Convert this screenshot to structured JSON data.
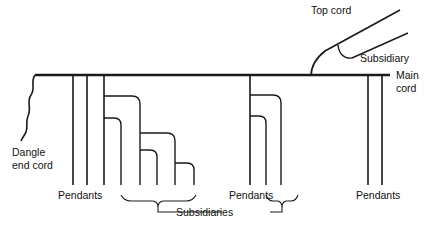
{
  "diagram": {
    "labels": {
      "dangle_end_cord_line1": "Dangle",
      "dangle_end_cord_line2": "end cord",
      "pendants_left": "Pendants",
      "pendants_middle": "Pendants",
      "pendants_right": "Pendants",
      "subsidiaries": "Subsidiaries",
      "subsidiary": "Subsidiary",
      "top_cord": "Top cord",
      "main_cord_line1": "Main",
      "main_cord_line2": "cord"
    },
    "colors": {
      "stroke": "#1a1a1a",
      "background": "#ffffff",
      "text": "#111111"
    },
    "structure": {
      "main_cord": {
        "x1": 35,
        "x2": 390,
        "y": 75
      },
      "dangle_end_cord": {
        "from_x": 35,
        "from_y": 75,
        "to_x": 22,
        "to_y": 140
      },
      "left_pendants_x": [
        73,
        87
      ],
      "middle_left_group_x": [
        104,
        121,
        140,
        157,
        175
      ],
      "middle_right_group_x": [
        250,
        266,
        281
      ],
      "right_pendants_x": [
        368,
        382
      ],
      "top_cord": {
        "base_x": 312,
        "base_y": 75,
        "tip_x": 400,
        "tip_y": 10
      },
      "subsidiary_branch": {
        "tip_x": 408,
        "tip_y": 33
      },
      "pendant_bottom_y": 185
    }
  }
}
